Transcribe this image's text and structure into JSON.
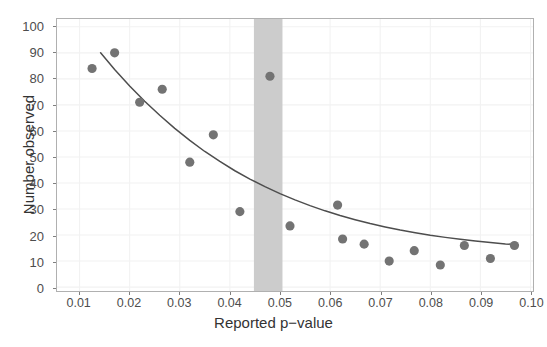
{
  "chart_data": {
    "type": "scatter",
    "title": "",
    "xlabel": "Reported p−value",
    "ylabel": "Number observed",
    "xlim": [
      0.0055,
      0.1005
    ],
    "ylim": [
      -1.5,
      103
    ],
    "xticks": [
      0.01,
      0.02,
      0.03,
      0.04,
      0.05,
      0.06,
      0.07,
      0.08,
      0.09,
      0.1
    ],
    "xticklabels": [
      "0.01",
      "0.02",
      "0.03",
      "0.04",
      "0.05",
      "0.06",
      "0.07",
      "0.08",
      "0.09",
      "0.10"
    ],
    "yticks": [
      0,
      10,
      20,
      30,
      40,
      50,
      60,
      70,
      80,
      90,
      100
    ],
    "yticklabels": [
      "0",
      "10",
      "20",
      "30",
      "40",
      "50",
      "60",
      "70",
      "80",
      "90",
      "100"
    ],
    "grid": true,
    "legend": "none",
    "points": [
      {
        "x": 0.0125,
        "y": 84
      },
      {
        "x": 0.017,
        "y": 90
      },
      {
        "x": 0.022,
        "y": 71
      },
      {
        "x": 0.0265,
        "y": 76
      },
      {
        "x": 0.032,
        "y": 48
      },
      {
        "x": 0.0367,
        "y": 58.5
      },
      {
        "x": 0.042,
        "y": 29
      },
      {
        "x": 0.048,
        "y": 81
      },
      {
        "x": 0.052,
        "y": 23.5
      },
      {
        "x": 0.0615,
        "y": 31.5
      },
      {
        "x": 0.0625,
        "y": 18.5
      },
      {
        "x": 0.0668,
        "y": 16.5
      },
      {
        "x": 0.0718,
        "y": 10
      },
      {
        "x": 0.0768,
        "y": 14
      },
      {
        "x": 0.082,
        "y": 8.5
      },
      {
        "x": 0.0868,
        "y": 16
      },
      {
        "x": 0.092,
        "y": 11
      },
      {
        "x": 0.0968,
        "y": 16
      }
    ],
    "fit_curve": {
      "name": "exponential-decay-fit",
      "x": [
        0.0142,
        0.017,
        0.02,
        0.023,
        0.026,
        0.029,
        0.032,
        0.035,
        0.038,
        0.041,
        0.044,
        0.047,
        0.05,
        0.053,
        0.056,
        0.059,
        0.062,
        0.065,
        0.068,
        0.071,
        0.074,
        0.077,
        0.08,
        0.083,
        0.086,
        0.089,
        0.092,
        0.095,
        0.0975
      ],
      "y": [
        90.0,
        83.6,
        77.3,
        71.4,
        66.0,
        61.0,
        56.4,
        52.1,
        48.3,
        44.7,
        41.5,
        38.6,
        35.9,
        33.5,
        31.3,
        29.3,
        27.5,
        25.9,
        24.4,
        23.1,
        21.9,
        20.9,
        19.9,
        19.1,
        18.4,
        17.7,
        17.1,
        16.6,
        16.3
      ]
    },
    "shaded_band": {
      "name": "significance-threshold-band",
      "x_start": 0.0448,
      "x_end": 0.0505,
      "color": "#cccccc"
    },
    "colors": {
      "point": "#737373",
      "curve": "#4d4d4d",
      "band": "#cccccc",
      "grid": "#f2f2f2",
      "panel_border": "#b0b0b0",
      "tick_label": "#4d4d4d",
      "axis_label": "#333333",
      "background": "#ffffff"
    }
  }
}
